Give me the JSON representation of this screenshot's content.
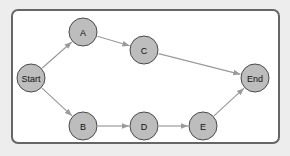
{
  "diagram": {
    "type": "directed-graph",
    "colors": {
      "node_fill": "#bdbdbd",
      "node_stroke": "#4a4a4a",
      "edge": "#9a9a9a",
      "frame_border": "#666666",
      "background": "#ededed"
    },
    "nodes": [
      {
        "id": "start",
        "label": "Start",
        "x": 31,
        "y": 78
      },
      {
        "id": "a",
        "label": "A",
        "x": 83,
        "y": 32
      },
      {
        "id": "c",
        "label": "C",
        "x": 144,
        "y": 50
      },
      {
        "id": "end",
        "label": "End",
        "x": 255,
        "y": 78
      },
      {
        "id": "b",
        "label": "B",
        "x": 83,
        "y": 126
      },
      {
        "id": "d",
        "label": "D",
        "x": 144,
        "y": 126
      },
      {
        "id": "e",
        "label": "E",
        "x": 203,
        "y": 126
      }
    ],
    "edges": [
      {
        "from": "Start",
        "to": "A"
      },
      {
        "from": "A",
        "to": "C"
      },
      {
        "from": "C",
        "to": "End"
      },
      {
        "from": "Start",
        "to": "B"
      },
      {
        "from": "B",
        "to": "D"
      },
      {
        "from": "D",
        "to": "E"
      },
      {
        "from": "E",
        "to": "End"
      }
    ]
  }
}
